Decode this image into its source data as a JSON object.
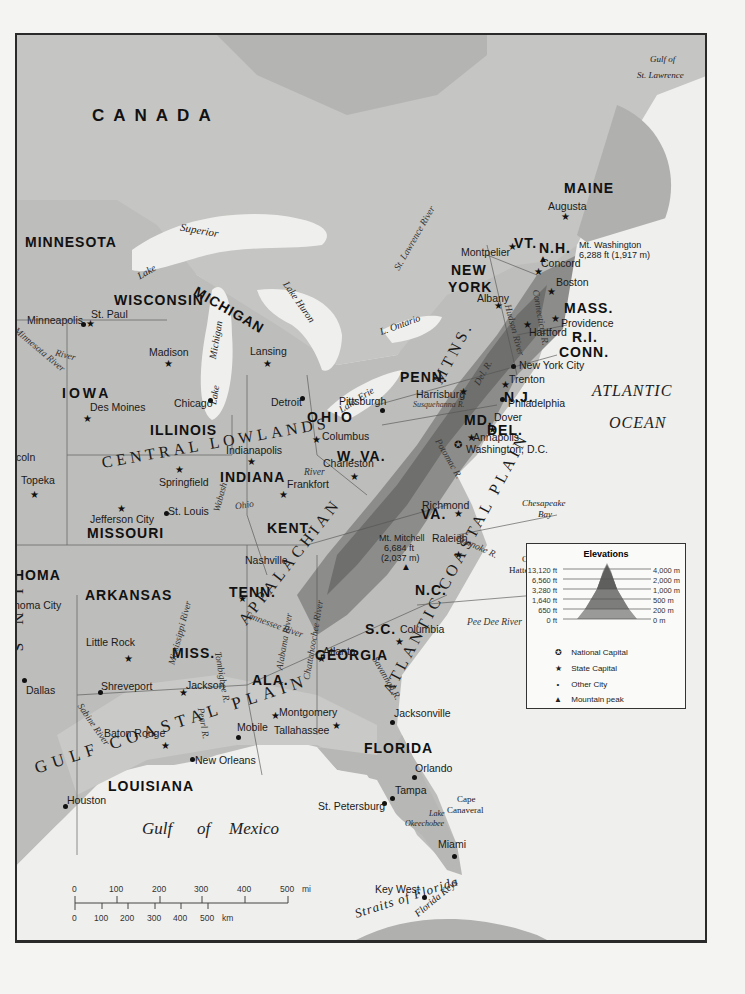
{
  "map": {
    "country": "CANADA",
    "waters": {
      "gulf_st_lawrence": [
        "Gulf of",
        "St. Lawrence"
      ],
      "atlantic": [
        "ATLANTIC",
        "OCEAN"
      ],
      "gulf_mexico": [
        "Gulf",
        "of",
        "Mexico"
      ],
      "straits_florida": "Straits of Florida",
      "chesapeake": [
        "Chesapeake",
        "Bay"
      ],
      "cape_hatteras": [
        "Cape",
        "Hatteras"
      ],
      "cape_canaveral": [
        "Cape",
        "Canaveral"
      ],
      "lake_superior": [
        "Lake",
        "Superior"
      ],
      "lake_michigan": [
        "Lake",
        "Michigan"
      ],
      "lake_huron": "Lake Huron",
      "lake_erie": "Lake Erie",
      "lake_ontario": "L. Ontario",
      "lake_okeechobee": [
        "Lake",
        "Okeechobee"
      ],
      "florida_keys": "Florida Keys"
    },
    "states": [
      {
        "label": "MINNESOTA"
      },
      {
        "label": "WISCONSIN"
      },
      {
        "label": "MICHIGAN"
      },
      {
        "label": "IOWA"
      },
      {
        "label": "ILLINOIS"
      },
      {
        "label": "INDIANA"
      },
      {
        "label": "OHIO"
      },
      {
        "label": "MISSOURI"
      },
      {
        "label": "KENT."
      },
      {
        "label": "TENN."
      },
      {
        "label": "ARKANSAS"
      },
      {
        "label": "MISS."
      },
      {
        "label": "ALA."
      },
      {
        "label": "GEORGIA"
      },
      {
        "label": "LOUISIANA"
      },
      {
        "label": "FLORIDA"
      },
      {
        "label": "S.C."
      },
      {
        "label": "N.C."
      },
      {
        "label": "VA."
      },
      {
        "label": "W. VA."
      },
      {
        "label": "PENN."
      },
      {
        "label": "MD."
      },
      {
        "label": "DEL."
      },
      {
        "label": "N.J."
      },
      {
        "label": "NEW"
      },
      {
        "label": "YORK"
      },
      {
        "label": "VT."
      },
      {
        "label": "N.H."
      },
      {
        "label": "MAINE"
      },
      {
        "label": "MASS."
      },
      {
        "label": "R.I."
      },
      {
        "label": "CONN."
      },
      {
        "label": "HOMA"
      }
    ],
    "regions": {
      "central_lowlands": "CENTRAL LOWLANDS",
      "appalachian": "APPALACHIAN",
      "mtns": "MTNS.",
      "atlantic_coastal": "ATLANTIC COASTAL PLAIN",
      "gulf_coastal": "GULF COASTAL PLAIN",
      "plains_partial": "INS"
    },
    "cities": [
      {
        "name": "Minneapolis",
        "type": "city"
      },
      {
        "name": "St. Paul",
        "type": "state"
      },
      {
        "name": "Madison",
        "type": "state"
      },
      {
        "name": "Lansing",
        "type": "state"
      },
      {
        "name": "Detroit",
        "type": "city"
      },
      {
        "name": "Chicago",
        "type": "city"
      },
      {
        "name": "Des Moines",
        "type": "state"
      },
      {
        "name": "coln",
        "type": "state"
      },
      {
        "name": "Topeka",
        "type": "state"
      },
      {
        "name": "Springfield",
        "type": "state"
      },
      {
        "name": "Indianapolis",
        "type": "state"
      },
      {
        "name": "Columbus",
        "type": "state"
      },
      {
        "name": "Pittsburgh",
        "type": "city"
      },
      {
        "name": "Charleston",
        "type": "state"
      },
      {
        "name": "Frankfort",
        "type": "state"
      },
      {
        "name": "St. Louis",
        "type": "city"
      },
      {
        "name": "Jefferson City",
        "type": "state"
      },
      {
        "name": "Nashville",
        "type": "state"
      },
      {
        "name": "Little Rock",
        "type": "state"
      },
      {
        "name": "homa City",
        "type": "state"
      },
      {
        "name": "Dallas",
        "type": "city"
      },
      {
        "name": "Shreveport",
        "type": "city"
      },
      {
        "name": "Jackson",
        "type": "state"
      },
      {
        "name": "Montgomery",
        "type": "state"
      },
      {
        "name": "Atlanta",
        "type": "state"
      },
      {
        "name": "Columbia",
        "type": "state"
      },
      {
        "name": "Raleigh",
        "type": "state"
      },
      {
        "name": "Richmond",
        "type": "state"
      },
      {
        "name": "Annapolis",
        "type": "state"
      },
      {
        "name": "Washington, D.C.",
        "type": "national"
      },
      {
        "name": "Dover",
        "type": "state"
      },
      {
        "name": "Philadelphia",
        "type": "city"
      },
      {
        "name": "Trenton",
        "type": "state"
      },
      {
        "name": "Harrisburg",
        "type": "state"
      },
      {
        "name": "New York City",
        "type": "city"
      },
      {
        "name": "Hartford",
        "type": "state"
      },
      {
        "name": "Providence",
        "type": "state"
      },
      {
        "name": "Boston",
        "type": "state"
      },
      {
        "name": "Concord",
        "type": "state"
      },
      {
        "name": "Montpelier",
        "type": "state"
      },
      {
        "name": "Albany",
        "type": "state"
      },
      {
        "name": "Augusta",
        "type": "state"
      },
      {
        "name": "Houston",
        "type": "city"
      },
      {
        "name": "Baton Rouge",
        "type": "state"
      },
      {
        "name": "New Orleans",
        "type": "city"
      },
      {
        "name": "Mobile",
        "type": "city"
      },
      {
        "name": "Tallahassee",
        "type": "state"
      },
      {
        "name": "Jacksonville",
        "type": "city"
      },
      {
        "name": "Orlando",
        "type": "city"
      },
      {
        "name": "Tampa",
        "type": "city"
      },
      {
        "name": "St. Petersburg",
        "type": "city"
      },
      {
        "name": "Miami",
        "type": "city"
      },
      {
        "name": "Key West",
        "type": "city"
      }
    ],
    "peaks": [
      {
        "name": "Mt. Washington",
        "elev": "6,288 ft (1,917 m)"
      },
      {
        "name": "Mt. Mitchell",
        "elev_ft": "6,684 ft",
        "elev_m": "(2,037 m)"
      }
    ],
    "rivers": [
      "St. Lawrence River",
      "Connecticut R.",
      "Hudson River",
      "Del. R.",
      "Susquehanna R.",
      "Potomac R.",
      "Roanoke R.",
      "Pee Dee River",
      "Savannah R.",
      "Chattahoochee River",
      "Alabama River",
      "Tombigbee R.",
      "Tennessee River",
      "Mississippi River",
      "Pearl R.",
      "Sabine River",
      "Ohio",
      "River",
      "Wabash",
      "Minnesota River",
      "River"
    ]
  },
  "legend": {
    "title": "Elevations",
    "levels_ft": [
      "13,120 ft",
      "6,560 ft",
      "3,280 ft",
      "1,640 ft",
      "650 ft",
      "0 ft"
    ],
    "levels_m": [
      "4,000 m",
      "2,000 m",
      "1,000 m",
      "500 m",
      "200 m",
      "0 m"
    ],
    "keys": [
      {
        "symbol": "✪",
        "label": "National Capital"
      },
      {
        "symbol": "★",
        "label": "State Capital"
      },
      {
        "symbol": "•",
        "label": "Other City"
      },
      {
        "symbol": "▲",
        "label": "Mountain peak"
      }
    ]
  },
  "scale": {
    "mi_ticks": [
      "0",
      "100",
      "200",
      "300",
      "400",
      "500"
    ],
    "mi_unit": "mi",
    "km_ticks": [
      "0",
      "100",
      "200",
      "300",
      "400",
      "500"
    ],
    "km_unit": "km"
  },
  "colors": {
    "water": "#efefed",
    "lowland": "#c9c9c7",
    "land": "#b4b4b2",
    "upland": "#8f8f8d",
    "mountain": "#6d6d6b",
    "canada": "#c3c3c1",
    "border": "#555555"
  }
}
